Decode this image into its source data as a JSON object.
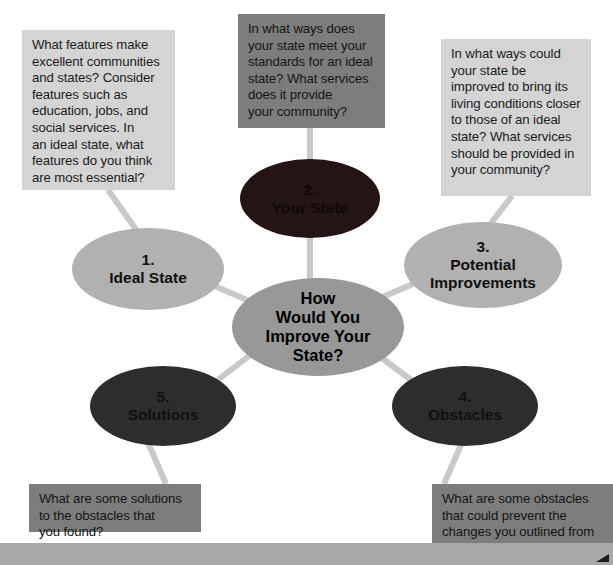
{
  "diagram": {
    "type": "mind-map",
    "title": "How Would You Improve Your State?",
    "center": {
      "label": "How\nWould You\nImprove Your\nState?",
      "color": "#989898"
    },
    "branches": [
      {
        "number": "1.",
        "label": "1.\nIdeal State",
        "color": "#b1b1b1",
        "callout": "What features make\nexcellent communities\nand states? Consider\nfeatures such as\neducation, jobs, and\nsocial services. In\nan ideal state, what\nfeatures do you think\nare most essential?",
        "callout_color": "#d4d4d4"
      },
      {
        "number": "2.",
        "label": "2.\nYour State",
        "color": "#241413",
        "callout": "In what ways does\nyour state meet your\nstandards for an ideal\nstate? What services\ndoes it provide\nyour community?",
        "callout_color": "#7d7d7d"
      },
      {
        "number": "3.",
        "label": "3.\nPotential\nImprovements",
        "color": "#b1b1b1",
        "callout": "In what ways could\nyour state be\nimproved to bring its\nliving conditions closer\nto those of an ideal\nstate? What services\nshould be provided in\nyour community?",
        "callout_color": "#d4d4d4"
      },
      {
        "number": "4.",
        "label": "4.\nObstacles",
        "color": "#2d2d2d",
        "callout": "What are some obstacles\nthat could prevent the\nchanges you outlined from\nbeing instituted?",
        "callout_color": "#7d7d7d"
      },
      {
        "number": "5.",
        "label": "5.\nSolutions",
        "color": "#2d2d2d",
        "callout": "What are some solutions\nto the obstacles that\nyou found?",
        "callout_color": "#7d7d7d"
      }
    ],
    "connector_color": "#c9c9c9",
    "bottom_bar_color": "#a8a8a8"
  }
}
